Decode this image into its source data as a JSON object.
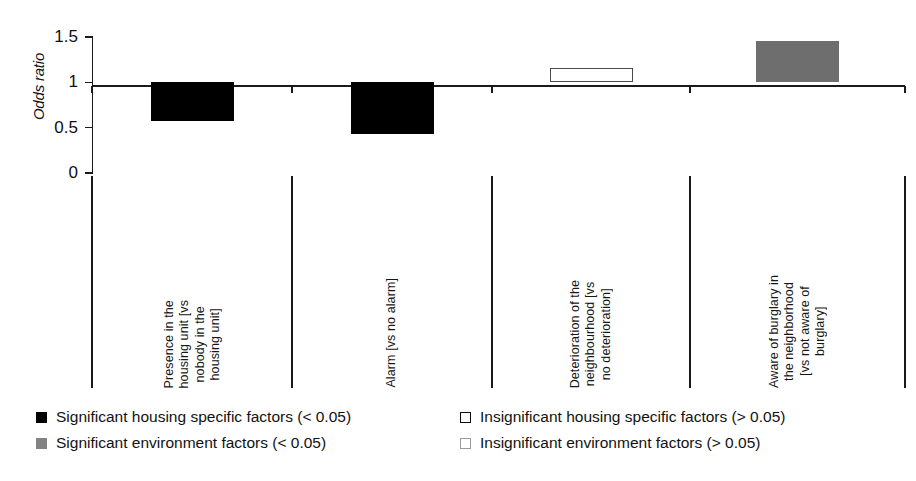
{
  "chart_data": {
    "type": "bar",
    "title": "",
    "xlabel": "",
    "ylabel": "Odds ratio",
    "ylim": [
      0,
      1.5
    ],
    "yticks": [
      0,
      0.5,
      1,
      1.5
    ],
    "ytick_labels": [
      "0",
      "0.5",
      "1",
      "1.5"
    ],
    "reference_line": 1,
    "grid": false,
    "legend_position": "bottom",
    "categories": [
      "Presence in the\nhousing unit [vs\nnobody in the\nhousing unit]",
      "Alarm [vs no alarm]",
      "Deterioration of the\nneighbourhood [vs\nno deterioration]",
      "Aware of burglary in\nthe neighborhood\n[vs not aware of\nburglary]"
    ],
    "values": [
      0.57,
      0.43,
      1.16,
      1.46
    ],
    "bar_styles": [
      "solid-black",
      "solid-black",
      "open",
      "solid-gray"
    ],
    "series": [
      {
        "name": "Odds ratio",
        "values": [
          0.57,
          0.43,
          1.16,
          1.46
        ]
      }
    ],
    "legend": [
      {
        "label": "Significant housing specific factors (< 0.05)",
        "swatch": "sw-black"
      },
      {
        "label": "Insignificant housing specific factors (> 0.05)",
        "swatch": "sw-open-dark"
      },
      {
        "label": "Significant environment factors (< 0.05)",
        "swatch": "sw-gray"
      },
      {
        "label": "Insignificant environment factors (> 0.05)",
        "swatch": "sw-open-light"
      }
    ],
    "colors": {
      "significant_housing": "#000000",
      "significant_environment": "#6e6e6e",
      "insignificant_housing": "#ffffff",
      "insignificant_environment": "#ffffff",
      "axis": "#1a1a1a"
    }
  }
}
